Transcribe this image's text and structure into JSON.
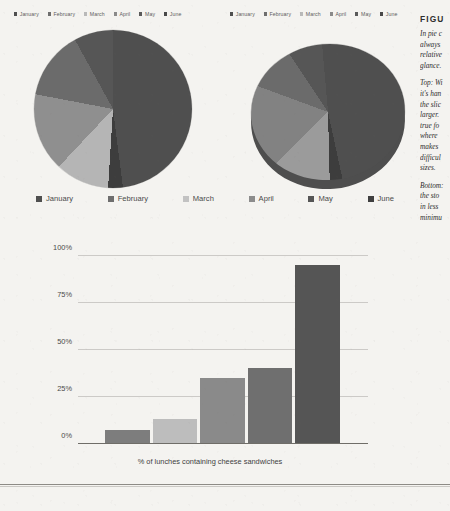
{
  "legend_top_left": {
    "items": [
      {
        "label": "January",
        "color": "#4f4f4f"
      },
      {
        "label": "February",
        "color": "#6e6e6e"
      },
      {
        "label": "March",
        "color": "#b9b9b9"
      },
      {
        "label": "April",
        "color": "#8a8a8a"
      },
      {
        "label": "May",
        "color": "#5a5a5a"
      },
      {
        "label": "June",
        "color": "#484848"
      }
    ]
  },
  "legend_top_right": {
    "items": [
      {
        "label": "January",
        "color": "#4f4f4f"
      },
      {
        "label": "February",
        "color": "#6e6e6e"
      },
      {
        "label": "March",
        "color": "#b9b9b9"
      },
      {
        "label": "April",
        "color": "#8a8a8a"
      },
      {
        "label": "May",
        "color": "#5a5a5a"
      },
      {
        "label": "June",
        "color": "#484848"
      }
    ]
  },
  "legend_main": {
    "items": [
      {
        "label": "January",
        "color": "#4f4f4f"
      },
      {
        "label": "February",
        "color": "#6e6e6e"
      },
      {
        "label": "March",
        "color": "#c2c2c2"
      },
      {
        "label": "April",
        "color": "#8c8c8c"
      },
      {
        "label": "May",
        "color": "#565656"
      },
      {
        "label": "June",
        "color": "#3f3f3f"
      }
    ]
  },
  "caption": {
    "heading": "FIGU",
    "paragraphs": [
      "In pie c\nalways\nrelative\nglance.",
      "Top: Wi\nit's han\nthe slic\nlarger.\ntrue fo\nwhere\nmakes\ndifficul\nsizes.",
      "Bottom:\nthe sto\nin less\nminimu"
    ]
  },
  "chart_data": [
    {
      "type": "pie",
      "title": "",
      "name": "pie-chart-flat",
      "categories": [
        "January",
        "February",
        "March",
        "April",
        "May",
        "June"
      ],
      "values": [
        48,
        3,
        11,
        16,
        14,
        8
      ],
      "colors": [
        "#4f4f4f",
        "#3d3d3d",
        "#b5b5b5",
        "#8f8f8f",
        "#6b6b6b",
        "#565656"
      ],
      "legend": "top",
      "start_angle": 0
    },
    {
      "type": "pie",
      "title": "",
      "name": "pie-chart-3d",
      "categories": [
        "January",
        "February",
        "March",
        "April",
        "May",
        "June"
      ],
      "values": [
        48,
        3,
        13,
        18,
        10,
        8
      ],
      "colors": [
        "#4f4f4f",
        "#3d3d3d",
        "#9b9b9b",
        "#828282",
        "#6b6b6b",
        "#565656"
      ],
      "legend": "top",
      "depth_color": "#4e4e4e"
    },
    {
      "type": "bar",
      "name": "bar-chart-lunches",
      "title": "",
      "xlabel": "% of lunches containing cheese sandwiches",
      "ylabel": "",
      "categories": [
        "January",
        "February",
        "March",
        "April",
        "May"
      ],
      "values": [
        7,
        13,
        35,
        40,
        95
      ],
      "colors": [
        "#7d7d7d",
        "#bdbdbd",
        "#8a8a8a",
        "#6f6f6f",
        "#555555"
      ],
      "ylim": [
        0,
        100
      ],
      "yticks": [
        "0%",
        "25%",
        "50%",
        "75%",
        "100%"
      ],
      "ytick_values": [
        0,
        25,
        50,
        75,
        100
      ],
      "grid": true,
      "legend_position": "above"
    }
  ]
}
